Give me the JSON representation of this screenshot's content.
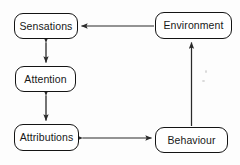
{
  "diagram": {
    "background_color": "#fdfdfd",
    "stroke_color": "#141414",
    "arrow_color": "#2a2a2a",
    "text_color": "#181818",
    "nodes": [
      {
        "id": "sensations",
        "label": "Sensations",
        "x": 14,
        "y": 13,
        "w": 64,
        "h": 26
      },
      {
        "id": "environment",
        "label": "Environment",
        "x": 155,
        "y": 12,
        "w": 77,
        "h": 27
      },
      {
        "id": "attention",
        "label": "Attention",
        "x": 15,
        "y": 66,
        "w": 61,
        "h": 26
      },
      {
        "id": "attributions",
        "label": "Attributions",
        "x": 14,
        "y": 124,
        "w": 65,
        "h": 27
      },
      {
        "id": "behaviour",
        "label": "Behaviour",
        "x": 155,
        "y": 127,
        "w": 73,
        "h": 26
      }
    ],
    "edges": [
      {
        "id": "environment-to-sensations",
        "from": "Environment",
        "to": "Sensations",
        "direction": "single",
        "orientation": "horizontal"
      },
      {
        "id": "sensations-attention",
        "from": "Sensations",
        "to": "Attention",
        "direction": "double",
        "orientation": "vertical"
      },
      {
        "id": "attention-attributions",
        "from": "Attention",
        "to": "Attributions",
        "direction": "double",
        "orientation": "vertical"
      },
      {
        "id": "attributions-behaviour",
        "from": "Attributions",
        "to": "Behaviour",
        "direction": "double",
        "orientation": "horizontal"
      },
      {
        "id": "behaviour-to-environment",
        "from": "Behaviour",
        "to": "Environment",
        "direction": "single",
        "orientation": "vertical"
      }
    ]
  }
}
